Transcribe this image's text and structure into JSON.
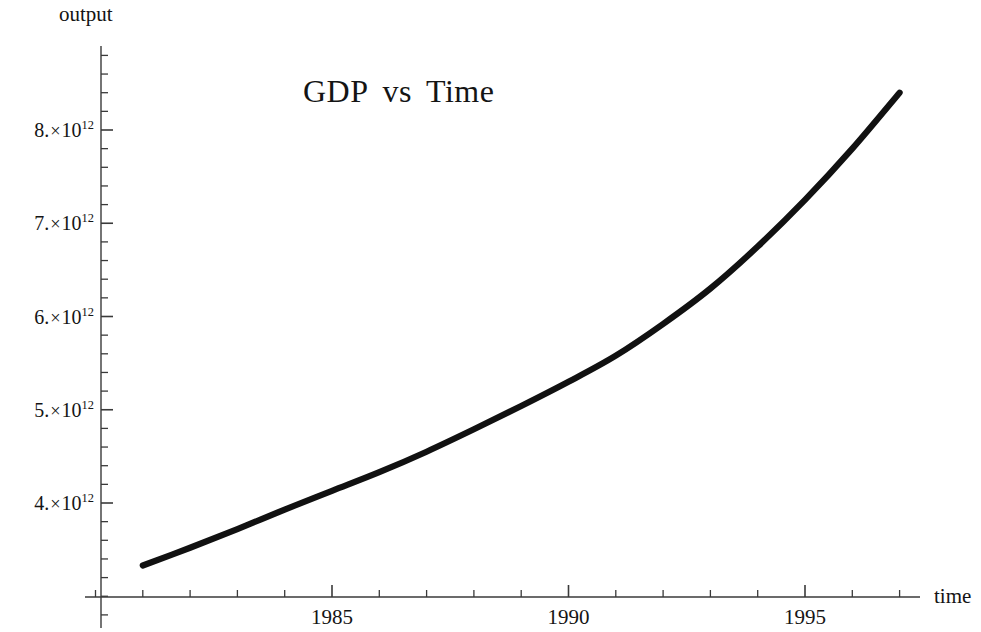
{
  "figure": {
    "title_words": [
      "GDP",
      "vs",
      "Time"
    ],
    "background_color": "#ffffff",
    "curve_color": "#111111",
    "axis_color": "#3a3a3a"
  },
  "axes": {
    "y_axis_title": "output",
    "x_axis_title": "time"
  },
  "chart_data": {
    "type": "line",
    "xlabel": "time",
    "ylabel": "output",
    "grid": false,
    "legend": null,
    "xlim": [
      1980.7,
      1997.7
    ],
    "ylim": [
      3350000000000,
      8800000000000
    ],
    "x_major_ticks": [
      1985,
      1990,
      1995
    ],
    "x_tick_labels": [
      "1985",
      "1990",
      "1995"
    ],
    "x_minor_tick_step": 1,
    "y_major_ticks": [
      4000000000000,
      5000000000000,
      6000000000000,
      7000000000000,
      8000000000000
    ],
    "y_tick_labels": [
      {
        "mantissa": "4.",
        "times": "×",
        "base": "10",
        "exponent": "12"
      },
      {
        "mantissa": "5.",
        "times": "×",
        "base": "10",
        "exponent": "12"
      },
      {
        "mantissa": "6.",
        "times": "×",
        "base": "10",
        "exponent": "12"
      },
      {
        "mantissa": "7.",
        "times": "×",
        "base": "10",
        "exponent": "12"
      },
      {
        "mantissa": "8.",
        "times": "×",
        "base": "10",
        "exponent": "12"
      }
    ],
    "y_minor_ticks_per_major": 5,
    "series": [
      {
        "name": "GDP",
        "x": [
          1981.0,
          1982.0,
          1983.0,
          1984.0,
          1985.0,
          1986.0,
          1987.0,
          1988.0,
          1989.0,
          1990.0,
          1991.0,
          1992.0,
          1993.0,
          1994.0,
          1995.0,
          1996.0,
          1997.0
        ],
        "y": [
          3330000000000,
          3520000000000,
          3720000000000,
          3930000000000,
          4130000000000,
          4330000000000,
          4550000000000,
          4790000000000,
          5040000000000,
          5300000000000,
          5580000000000,
          5920000000000,
          6300000000000,
          6750000000000,
          7250000000000,
          7800000000000,
          8400000000000
        ]
      }
    ]
  },
  "ticks": {
    "y_labels": [
      "8.×10¹²",
      "7.×10¹²",
      "6.×10¹²",
      "5.×10¹²",
      "4.×10¹²"
    ],
    "x_labels": [
      "1985",
      "1990",
      "1995"
    ]
  }
}
